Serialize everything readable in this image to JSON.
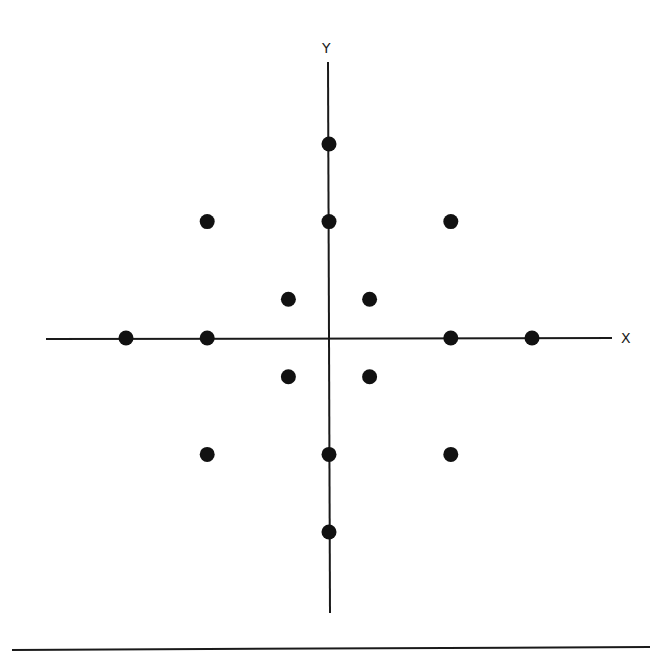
{
  "chart_data": {
    "type": "scatter",
    "title": "",
    "xlabel": "X",
    "ylabel": "Y",
    "grid": false,
    "legend": null,
    "xlim": [
      -5,
      5
    ],
    "ylim": [
      -5,
      5
    ],
    "points": [
      {
        "x": 0,
        "y": 5
      },
      {
        "x": -3,
        "y": 3
      },
      {
        "x": 0,
        "y": 3
      },
      {
        "x": 3,
        "y": 3
      },
      {
        "x": -1,
        "y": 1
      },
      {
        "x": 1,
        "y": 1
      },
      {
        "x": -5,
        "y": 0
      },
      {
        "x": -3,
        "y": 0
      },
      {
        "x": 3,
        "y": 0
      },
      {
        "x": 5,
        "y": 0
      },
      {
        "x": -1,
        "y": -1
      },
      {
        "x": 1,
        "y": -1
      },
      {
        "x": -3,
        "y": -3
      },
      {
        "x": 0,
        "y": -3
      },
      {
        "x": 3,
        "y": -3
      },
      {
        "x": 0,
        "y": -5
      }
    ]
  },
  "axes": {
    "x_label": "X",
    "y_label": "Y",
    "color": "#1a1a1a"
  },
  "style": {
    "point_color": "#111111",
    "line_color": "#1a1a1a"
  }
}
